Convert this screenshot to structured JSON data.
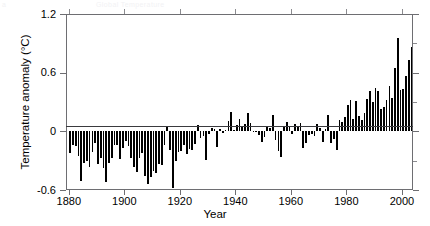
{
  "cropped_header": {
    "left_fragment": "a",
    "mid_fragment": "Global Temperature"
  },
  "axis": {
    "y_title": "Temperature anomaly (°C)",
    "x_title": "Year",
    "y_ticks": [
      "1.2",
      "0.6",
      "0",
      "-0.6"
    ],
    "x_ticks": [
      "1880",
      "1900",
      "1920",
      "1940",
      "1960",
      "1980",
      "2000"
    ]
  },
  "chart_data": {
    "type": "bar",
    "title": "",
    "xlabel": "Year",
    "ylabel": "Temperature anomaly (°C)",
    "xlim": [
      1879,
      2004
    ],
    "ylim": [
      -0.6,
      1.2
    ],
    "yticks": [
      -0.6,
      0,
      0.6,
      1.2
    ],
    "xticks": [
      1880,
      1900,
      1920,
      1940,
      1960,
      1980,
      2000
    ],
    "grid": false,
    "legend": null,
    "bar_color": "#000000",
    "x": [
      1880,
      1881,
      1882,
      1883,
      1884,
      1885,
      1886,
      1887,
      1888,
      1889,
      1890,
      1891,
      1892,
      1893,
      1894,
      1895,
      1896,
      1897,
      1898,
      1899,
      1900,
      1901,
      1902,
      1903,
      1904,
      1905,
      1906,
      1907,
      1908,
      1909,
      1910,
      1911,
      1912,
      1913,
      1914,
      1915,
      1916,
      1917,
      1918,
      1919,
      1920,
      1921,
      1922,
      1923,
      1924,
      1925,
      1926,
      1927,
      1928,
      1929,
      1930,
      1931,
      1932,
      1933,
      1934,
      1935,
      1936,
      1937,
      1938,
      1939,
      1940,
      1941,
      1942,
      1943,
      1944,
      1945,
      1946,
      1947,
      1948,
      1949,
      1950,
      1951,
      1952,
      1953,
      1954,
      1955,
      1956,
      1957,
      1958,
      1959,
      1960,
      1961,
      1962,
      1963,
      1964,
      1965,
      1966,
      1967,
      1968,
      1969,
      1970,
      1971,
      1972,
      1973,
      1974,
      1975,
      1976,
      1977,
      1978,
      1979,
      1980,
      1981,
      1982,
      1983,
      1984,
      1985,
      1986,
      1987,
      1988,
      1989,
      1990,
      1991,
      1992,
      1993,
      1994,
      1995,
      1996,
      1997,
      1998,
      1999,
      2000,
      2001,
      2002,
      2003
    ],
    "values": [
      -0.22,
      -0.14,
      -0.15,
      -0.25,
      -0.51,
      -0.32,
      -0.3,
      -0.36,
      -0.21,
      -0.12,
      -0.33,
      -0.27,
      -0.37,
      -0.52,
      -0.32,
      -0.27,
      -0.14,
      -0.14,
      -0.28,
      -0.17,
      -0.1,
      -0.15,
      -0.27,
      -0.36,
      -0.42,
      -0.27,
      -0.22,
      -0.46,
      -0.54,
      -0.47,
      -0.41,
      -0.43,
      -0.33,
      -0.34,
      -0.14,
      0.04,
      -0.19,
      -0.58,
      -0.3,
      -0.21,
      -0.2,
      -0.14,
      -0.23,
      -0.18,
      -0.19,
      -0.13,
      0.06,
      -0.07,
      -0.05,
      -0.29,
      -0.03,
      0.03,
      0.02,
      -0.16,
      0.02,
      -0.02,
      0.01,
      0.11,
      0.2,
      0.01,
      0.06,
      0.13,
      0.05,
      0.08,
      0.19,
      0.09,
      0.0,
      -0.01,
      -0.04,
      -0.11,
      -0.06,
      0.04,
      0.03,
      0.17,
      -0.09,
      -0.2,
      -0.26,
      0.04,
      0.1,
      0.04,
      -0.03,
      0.07,
      0.04,
      0.09,
      -0.17,
      -0.12,
      -0.04,
      -0.03,
      -0.05,
      0.07,
      0.03,
      -0.11,
      0.02,
      0.17,
      -0.12,
      -0.08,
      -0.19,
      0.12,
      0.1,
      0.15,
      0.27,
      0.32,
      0.13,
      0.31,
      0.16,
      0.12,
      0.19,
      0.33,
      0.41,
      0.3,
      0.44,
      0.41,
      0.23,
      0.25,
      0.32,
      0.46,
      0.34,
      0.65,
      0.95,
      0.42,
      0.43,
      0.57,
      0.73,
      0.86
    ]
  }
}
